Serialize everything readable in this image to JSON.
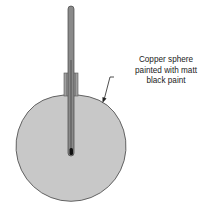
{
  "diagram": {
    "type": "apparatus",
    "components": [
      {
        "id": "copper-sphere",
        "shape": "circle",
        "fill": "#c8c8c8",
        "stroke": "#555555"
      },
      {
        "id": "thermometer",
        "shape": "tube",
        "fill": "#8a8a8a",
        "stroke": "#444444"
      },
      {
        "id": "stopper",
        "shape": "rect",
        "fill": "#9a9a9a"
      },
      {
        "id": "thermometer-bulb",
        "shape": "rounded-rect",
        "fill": "#111111"
      }
    ],
    "label": {
      "lines": [
        "Copper sphere",
        "painted with matt",
        "black paint"
      ],
      "target": "copper-sphere"
    },
    "colors": {
      "sphere_fill": "#c8c8c8",
      "outline": "#555555",
      "thermometer": "#8a8a8a",
      "bulb": "#111111",
      "text": "#222222"
    }
  }
}
